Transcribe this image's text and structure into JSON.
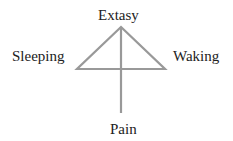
{
  "diagram": {
    "labels": {
      "top": "Extasy",
      "left": "Sleeping",
      "right": "Waking",
      "bottom": "Pain"
    },
    "line_color": "#999999",
    "text_color": "#222222"
  }
}
